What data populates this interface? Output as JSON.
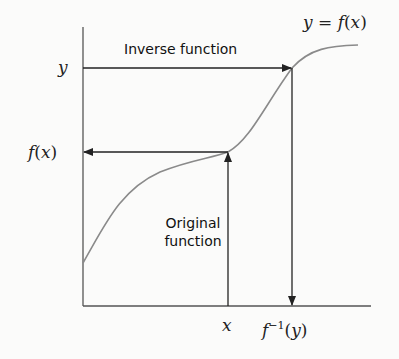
{
  "diagram": {
    "type": "function-inverse-illustration",
    "curve_label": {
      "lhs": "y",
      "eq": " = ",
      "fn": "f",
      "open": "(",
      "arg": "x",
      "close": ")"
    },
    "top_arrow_label": "Inverse function",
    "bottom_arrow_label_line1": "Original",
    "bottom_arrow_label_line2": "function",
    "y_axis_labels": {
      "y": "y",
      "fx_fn": "f",
      "fx_open": "(",
      "fx_arg": "x",
      "fx_close": ")"
    },
    "x_axis_labels": {
      "x": "x",
      "finv_fn": "f",
      "finv_sup": "−1",
      "finv_open": "(",
      "finv_arg": "y",
      "finv_close": ")"
    },
    "colors": {
      "axis": "#555555",
      "curve": "#8a8a8a",
      "arrow": "#222222",
      "background": "#fbfbfa"
    }
  }
}
